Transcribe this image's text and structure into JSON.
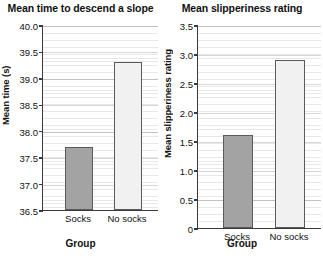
{
  "figure": {
    "width": 323,
    "height": 258,
    "background": "#ffffff",
    "bar_dark_color": "#a3a3a3",
    "bar_light_color": "#f1f1f1",
    "bar_edge_color": "#5a5a5a",
    "axis_color": "#3a3a3a"
  },
  "panels": [
    {
      "id": "mean-time",
      "title": "Mean time to descend a slope",
      "ylabel": "Mean time (s)",
      "xlabel": "Group",
      "yticks": [
        "36.5",
        "37.0",
        "37.5",
        "38.0",
        "38.5",
        "39.0",
        "39.5",
        "40.0"
      ],
      "categories": [
        "Socks",
        "No socks"
      ],
      "values": [
        37.7,
        39.3
      ]
    },
    {
      "id": "mean-slipperiness",
      "title": "Mean slipperiness rating",
      "ylabel": "Mean slipperiness rating",
      "xlabel": "Group",
      "yticks": [
        "0",
        "0.5",
        "1.0",
        "1.5",
        "2.0",
        "2.5",
        "3.0",
        "3.5"
      ],
      "categories": [
        "Socks",
        "No socks"
      ],
      "values": [
        1.6,
        2.9
      ]
    }
  ],
  "chart_data": [
    {
      "type": "bar",
      "title": "Mean time to descend a slope",
      "xlabel": "Group",
      "ylabel": "Mean time (s)",
      "categories": [
        "Socks",
        "No socks"
      ],
      "values": [
        37.7,
        39.3
      ],
      "ylim": [
        36.5,
        40.0
      ],
      "ytick_values": [
        36.5,
        37.0,
        37.5,
        38.0,
        38.5,
        39.0,
        39.5,
        40.0
      ],
      "ytick_labels": [
        "36.5",
        "37.0",
        "37.5",
        "38.0",
        "38.5",
        "39.0",
        "39.5",
        "40.0"
      ],
      "bar_colors": [
        "#a3a3a3",
        "#f1f1f1"
      ],
      "grid": true,
      "grid_axis": "y",
      "legend": false
    },
    {
      "type": "bar",
      "title": "Mean slipperiness rating",
      "xlabel": "Group",
      "ylabel": "Mean slipperiness rating",
      "categories": [
        "Socks",
        "No socks"
      ],
      "values": [
        1.6,
        2.9
      ],
      "ylim": [
        0,
        3.5
      ],
      "ytick_values": [
        0,
        0.5,
        1.0,
        1.5,
        2.0,
        2.5,
        3.0,
        3.5
      ],
      "ytick_labels": [
        "0",
        "0.5",
        "1.0",
        "1.5",
        "2.0",
        "2.5",
        "3.0",
        "3.5"
      ],
      "bar_colors": [
        "#a3a3a3",
        "#f1f1f1"
      ],
      "grid": true,
      "grid_axis": "y",
      "legend": false
    }
  ]
}
